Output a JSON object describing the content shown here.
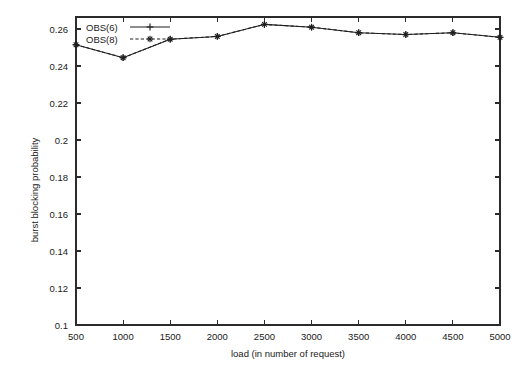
{
  "chart_data": {
    "type": "line",
    "title": "",
    "xlabel": "load (in number of request)",
    "ylabel": "burst blocking probability",
    "x": [
      500,
      1000,
      1500,
      2000,
      2500,
      3000,
      3500,
      4000,
      4500,
      5000
    ],
    "xticklabels": [
      "500",
      "1000",
      "1500",
      "2000",
      "2500",
      "3000",
      "3500",
      "4000",
      "4500",
      "5000"
    ],
    "yticklabels": [
      "0.1",
      "0.12",
      "0.14",
      "0.16",
      "0.18",
      "0.2",
      "0.22",
      "0.24",
      "0.26"
    ],
    "yticks": [
      0.1,
      0.12,
      0.14,
      0.16,
      0.18,
      0.2,
      0.22,
      0.24,
      0.26
    ],
    "xlim": [
      500,
      5000
    ],
    "ylim": [
      0.1,
      0.2665
    ],
    "grid": false,
    "legend_position": "top-left-inside",
    "series": [
      {
        "name": "OBS(6)",
        "linestyle": "solid",
        "marker": "plus",
        "color": "#1f1f1f",
        "values": [
          0.2515,
          0.2445,
          0.2545,
          0.256,
          0.2625,
          0.261,
          0.258,
          0.257,
          0.258,
          0.2555
        ]
      },
      {
        "name": "OBS(8)",
        "linestyle": "dashed",
        "marker": "star",
        "color": "#1f1f1f",
        "values": [
          0.2515,
          0.2445,
          0.2545,
          0.256,
          0.2625,
          0.261,
          0.258,
          0.257,
          0.258,
          0.2555
        ]
      }
    ]
  },
  "legend": {
    "entries": [
      {
        "label": "OBS(6)"
      },
      {
        "label": "OBS(8)"
      }
    ]
  },
  "axes": {
    "x_title": "load (in number of request)",
    "y_title": "burst blocking probability"
  }
}
